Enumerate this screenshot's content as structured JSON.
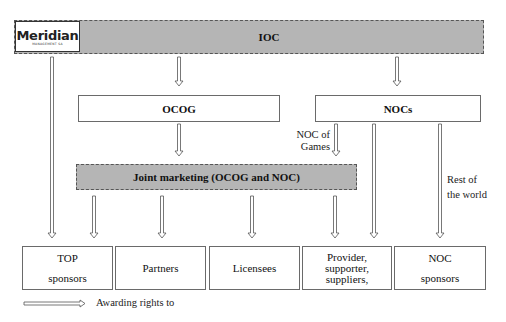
{
  "logo": {
    "name": "Meridian",
    "subtitle": "MANAGEMENT SA"
  },
  "nodes": {
    "ioc": "IOC",
    "ocog": "OCOG",
    "nocs": "NOCs",
    "joint": "Joint marketing (OCOG and NOC)"
  },
  "edge_labels": {
    "noc_of_games_1": "NOC of",
    "noc_of_games_2": "Games",
    "rest_1": "Rest of",
    "rest_2": "the world"
  },
  "recipients": [
    {
      "line1": "TOP",
      "line2": "sponsors"
    },
    {
      "line1": "Partners"
    },
    {
      "line1": "Licensees"
    },
    {
      "line1": "Provider,",
      "line2": "supporter,",
      "line3": "suppliers,"
    },
    {
      "line1": "NOC",
      "line2": "sponsors"
    }
  ],
  "legend": {
    "label": "Awarding rights to"
  },
  "colors": {
    "border": "#6a6a6a",
    "hatch": "#d9d9d9",
    "arrow": "#555555"
  }
}
